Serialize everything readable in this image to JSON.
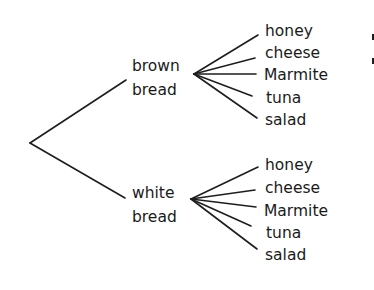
{
  "diagram": {
    "type": "tree",
    "root": "",
    "branches": [
      {
        "label_line1": "brown",
        "label_line2": "bread",
        "leaves": [
          "honey",
          "cheese",
          "Marmite",
          "tuna",
          "salad"
        ]
      },
      {
        "label_line1": "white",
        "label_line2": "bread",
        "leaves": [
          "honey",
          "cheese",
          "Marmite",
          "tuna",
          "salad"
        ]
      }
    ],
    "colors": {
      "line": "#1e1e1e",
      "text": "#1a1a1a",
      "background": "#ffffff"
    }
  }
}
